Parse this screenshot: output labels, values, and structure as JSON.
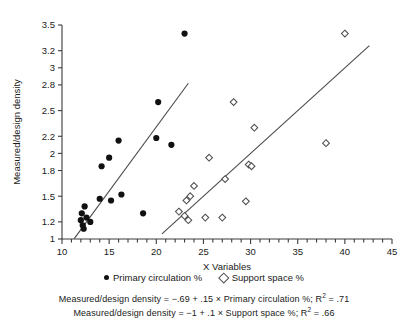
{
  "chart_data": {
    "type": "scatter",
    "title": "",
    "xlabel": "X Variables",
    "ylabel": "Measured/design density",
    "xlim": [
      10,
      45
    ],
    "ylim": [
      1,
      3.5
    ],
    "grid": false,
    "legend_position": "bottom",
    "xticks": [
      10,
      15,
      20,
      25,
      30,
      35,
      40,
      45
    ],
    "xtick_labels": [
      "10",
      "15",
      "20",
      "25",
      "30",
      "35",
      "40",
      "45"
    ],
    "x_minor_tick_step": 1,
    "yticks": [
      1,
      1.2,
      1.5,
      1.8,
      2,
      2.2,
      2.5,
      2.8,
      3,
      3.2,
      3.5
    ],
    "ytick_labels": [
      "1",
      "1.2",
      "1.5",
      "1.8",
      "2",
      "2.2",
      "2.5",
      "2.8",
      "3",
      "3.2",
      "3.5"
    ],
    "series": [
      {
        "name": "Primary circulation %",
        "marker": "filled-circle",
        "color": "#111111",
        "points": [
          [
            12.0,
            1.22
          ],
          [
            12.1,
            1.3
          ],
          [
            12.2,
            1.16
          ],
          [
            12.3,
            1.12
          ],
          [
            12.4,
            1.38
          ],
          [
            12.6,
            1.25
          ],
          [
            13.0,
            1.2
          ],
          [
            14.0,
            1.47
          ],
          [
            14.2,
            1.85
          ],
          [
            15.0,
            1.95
          ],
          [
            15.2,
            1.45
          ],
          [
            16.0,
            2.15
          ],
          [
            16.3,
            1.52
          ],
          [
            18.6,
            1.3
          ],
          [
            20.0,
            2.18
          ],
          [
            20.2,
            2.6
          ],
          [
            21.6,
            2.1
          ],
          [
            23.0,
            3.4
          ]
        ]
      },
      {
        "name": "Support space %",
        "marker": "open-diamond",
        "color": "#4d4d4d",
        "points": [
          [
            22.4,
            1.32
          ],
          [
            23.0,
            1.27
          ],
          [
            23.2,
            1.45
          ],
          [
            23.4,
            1.22
          ],
          [
            23.6,
            1.5
          ],
          [
            24.0,
            1.62
          ],
          [
            25.2,
            1.25
          ],
          [
            25.6,
            1.95
          ],
          [
            27.0,
            1.25
          ],
          [
            27.3,
            1.7
          ],
          [
            28.2,
            2.6
          ],
          [
            29.5,
            1.44
          ],
          [
            29.8,
            1.87
          ],
          [
            30.1,
            1.85
          ],
          [
            30.4,
            2.3
          ],
          [
            38.0,
            2.12
          ],
          [
            40.0,
            3.4
          ]
        ]
      }
    ],
    "fit_lines": [
      {
        "series": "Primary circulation %",
        "intercept": -0.69,
        "slope": 0.15,
        "r_squared": 0.71,
        "x_start": 11.3,
        "x_end": 23.4
      },
      {
        "series": "Support space %",
        "intercept": -1,
        "slope": 0.1,
        "r_squared": 0.66,
        "x_start": 20.6,
        "x_end": 42.6
      }
    ],
    "annotations": [
      "Measured/design density = −.69 + .15 × Primary circulation %; R² = .71",
      "Measured/design density = −1 + .1 × Support space %; R² = .66"
    ]
  },
  "legend": {
    "items": [
      {
        "label": "Primary circulation %",
        "marker": "filled-circle"
      },
      {
        "label": "Support space %",
        "marker": "open-diamond"
      }
    ]
  },
  "captions": {
    "line1_prefix": "Measured/design density = −.69 + .15 × Primary circulation %; R",
    "line1_sup": "2",
    "line1_suffix": " = .71",
    "line2_prefix": "Measured/design density = −1 + .1 × Support space %; R",
    "line2_sup": "2",
    "line2_suffix": " = .66"
  }
}
